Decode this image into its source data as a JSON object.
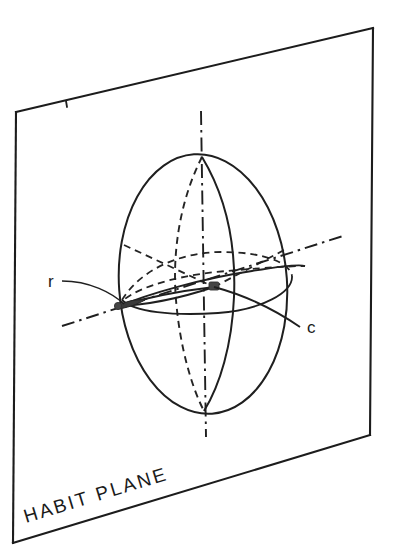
{
  "figure": {
    "background_color": "#ffffff",
    "ink_color": "#1a1a1a"
  },
  "plane": {
    "name": "habit-plane",
    "label": "HABIT PLANE",
    "label_rotation_deg": -17,
    "corners": {
      "top_left": [
        16,
        112
      ],
      "top_right": [
        373,
        28
      ],
      "bottom_right": [
        370,
        435
      ],
      "bottom_left": [
        13,
        543
      ]
    }
  },
  "sphere": {
    "name": "deformation-sphere",
    "center": [
      203,
      284
    ],
    "semi_axis_major": 130,
    "semi_axis_minor": 84,
    "tilt_deg": -4,
    "north_pole": [
      202,
      156
    ],
    "south_pole": [
      204,
      411
    ]
  },
  "axes": [
    {
      "name": "vertical-axis",
      "style": "dash-dot",
      "from": [
        201,
        111
      ],
      "to": [
        206,
        437
      ]
    },
    {
      "name": "r-axis",
      "style": "dash-dot",
      "from": [
        62,
        326
      ],
      "to": [
        343,
        236
      ]
    }
  ],
  "labels": {
    "r": {
      "text": "r",
      "x": 52,
      "y": 286,
      "leader_from": [
        62,
        281
      ],
      "leader_to": [
        128,
        302
      ]
    },
    "c": {
      "text": "c",
      "x": 309,
      "y": 331,
      "curve_from": [
        215,
        286
      ],
      "curve_to": [
        300,
        325
      ]
    }
  },
  "features": {
    "lens": {
      "name": "deformation-lens",
      "tip_left": [
        117,
        307
      ],
      "tip_right": [
        214,
        286
      ],
      "description": "flattened lens / needle between contact points"
    },
    "contact_point_left": [
      118,
      307
    ],
    "contact_point_right": [
      214,
      286
    ]
  },
  "curves": [
    {
      "name": "meridian-front-solid",
      "style": "solid"
    },
    {
      "name": "meridian-back-dashed",
      "style": "dashed"
    },
    {
      "name": "equator-front-solid",
      "style": "solid"
    },
    {
      "name": "equator-back-dashed",
      "style": "dashed"
    },
    {
      "name": "great-circle-tilted",
      "style": "solid"
    }
  ]
}
